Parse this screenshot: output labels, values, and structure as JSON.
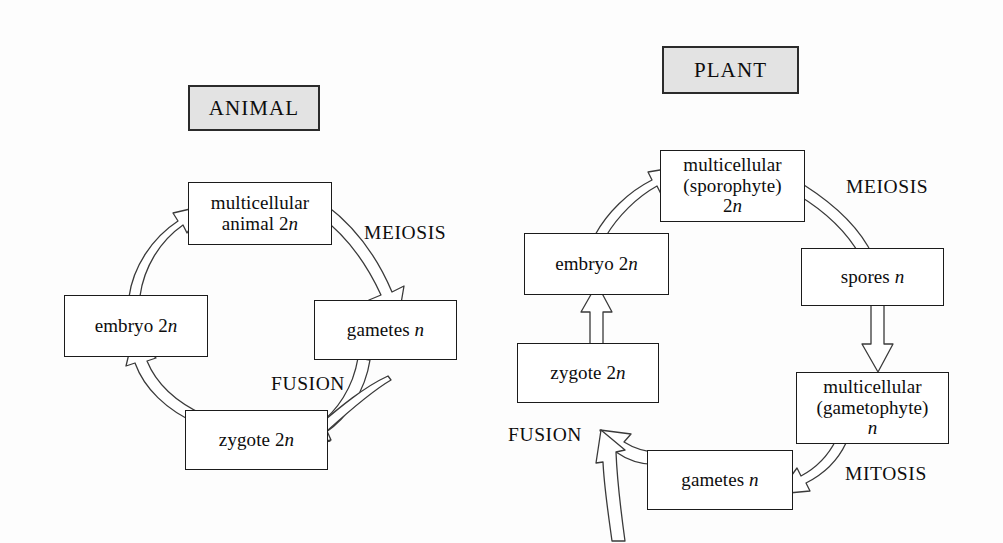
{
  "figure": {
    "background_color": "#fdfdfd",
    "line_color": "#1b1b1b",
    "header_fill": "#e3e3e3",
    "text_color": "#0d0d0d"
  },
  "animal_cycle": {
    "header": "ANIMAL",
    "nodes": {
      "multicellular": {
        "line1": "multicellular",
        "line2_pre": "animal 2",
        "line2_italic": "n"
      },
      "gametes": {
        "pre": "gametes ",
        "italic": "n"
      },
      "zygote": {
        "pre": "zygote 2",
        "italic": "n"
      },
      "embryo": {
        "pre": "embryo 2",
        "italic": "n"
      }
    },
    "process_labels": {
      "meiosis": "MEIOSIS",
      "fusion": "FUSION"
    }
  },
  "plant_cycle": {
    "header": "PLANT",
    "nodes": {
      "sporophyte": {
        "line1": "multicellular",
        "line2": "(sporophyte)",
        "line3_pre": "2",
        "line3_italic": "n"
      },
      "spores": {
        "pre": "spores ",
        "italic": "n"
      },
      "gametophyte": {
        "line1": "multicellular",
        "line2": "(gametophyte)",
        "line3_italic": "n"
      },
      "gametes": {
        "pre": "gametes ",
        "italic": "n"
      },
      "zygote": {
        "pre": "zygote 2",
        "italic": "n"
      },
      "embryo": {
        "pre": "embryo 2",
        "italic": "n"
      }
    },
    "process_labels": {
      "meiosis": "MEIOSIS",
      "mitosis": "MITOSIS",
      "fusion": "FUSION"
    }
  }
}
